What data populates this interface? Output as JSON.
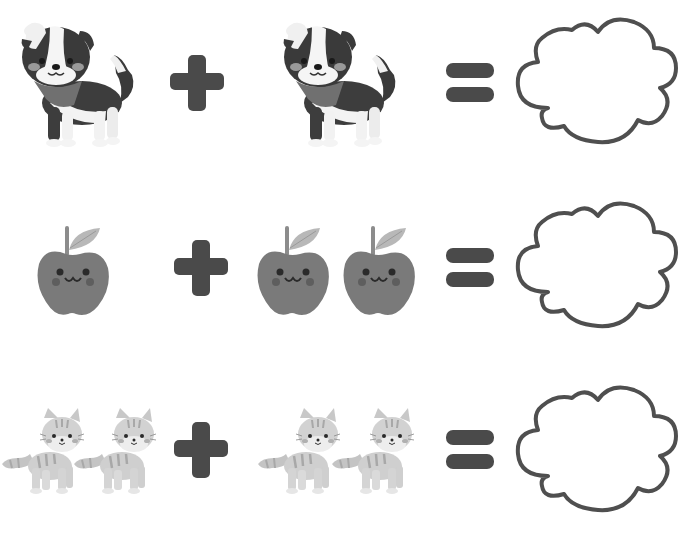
{
  "worksheet": {
    "title": "",
    "colors": {
      "operator": "#4a4a4a",
      "cloud_stroke": "#4f4f4f",
      "background": "#ffffff"
    },
    "rows": [
      {
        "id": "dogs",
        "left": {
          "item": "dog",
          "count": 1
        },
        "operator": "plus",
        "right": {
          "item": "dog",
          "count": 1
        },
        "equals": "equals",
        "answer_box": "cloud-empty"
      },
      {
        "id": "apples",
        "left": {
          "item": "apple",
          "count": 1
        },
        "operator": "plus",
        "right": {
          "item": "apple",
          "count": 2
        },
        "equals": "equals",
        "answer_box": "cloud-empty"
      },
      {
        "id": "cats",
        "left": {
          "item": "cat",
          "count": 2
        },
        "operator": "plus",
        "right": {
          "item": "cat",
          "count": 2
        },
        "equals": "equals",
        "answer_box": "cloud-empty"
      }
    ]
  }
}
